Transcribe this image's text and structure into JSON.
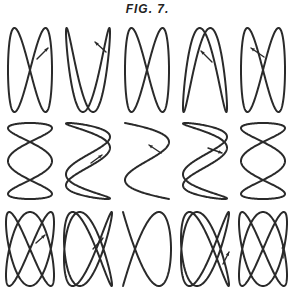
{
  "title": "FIG. 7.",
  "figure": {
    "rows": [
      {
        "name": "ratio-1-2",
        "fx": 1,
        "fy": 2,
        "cy": 70,
        "ry": 42,
        "rx": 22,
        "items": [
          {
            "cx": 30,
            "phase": 0.0,
            "arrow": {
              "x1": 37,
              "y1": 59,
              "x2": 48,
              "y2": 48
            }
          },
          {
            "cx": 88,
            "phase": 0.55,
            "arrow": {
              "x1": 106,
              "y1": 52,
              "x2": 95,
              "y2": 42
            }
          },
          {
            "cx": 147,
            "phase": 1.5708,
            "arrow": null
          },
          {
            "cx": 205,
            "phase": 2.6,
            "arrow": {
              "x1": 212,
              "y1": 62,
              "x2": 201,
              "y2": 51
            }
          },
          {
            "cx": 263,
            "phase": 3.14159,
            "arrow": {
              "x1": 264,
              "y1": 57,
              "x2": 251,
              "y2": 48
            }
          }
        ]
      },
      {
        "name": "ratio-3-1",
        "fx": 3,
        "fy": 1,
        "cy": 161,
        "ry": 38,
        "rx": 22,
        "items": [
          {
            "cx": 30,
            "phase": 1.5708,
            "arrow": null
          },
          {
            "cx": 88,
            "phase": 0.5,
            "arrow": {
              "x1": 91,
              "y1": 163,
              "x2": 102,
              "y2": 155
            }
          },
          {
            "cx": 147,
            "phase": 0.0,
            "arrow": {
              "x1": 161,
              "y1": 153,
              "x2": 149,
              "y2": 145
            }
          },
          {
            "cx": 205,
            "phase": -0.5,
            "arrow": {
              "x1": 208,
              "y1": 148,
              "x2": 222,
              "y2": 153
            }
          },
          {
            "cx": 263,
            "phase": -1.5708,
            "arrow": null
          }
        ]
      },
      {
        "name": "ratio-2-3",
        "fx": 2,
        "fy": 3,
        "cy": 249,
        "ry": 37,
        "rx": 24,
        "items": [
          {
            "cx": 30,
            "phase": 0.0,
            "arrow": {
              "x1": 36,
              "y1": 243,
              "x2": 45,
              "y2": 235
            }
          },
          {
            "cx": 88,
            "phase": 0.35,
            "arrow": {
              "x1": 93,
              "y1": 249,
              "x2": 103,
              "y2": 238
            }
          },
          {
            "cx": 147,
            "phase": 1.5708,
            "arrow": null
          },
          {
            "cx": 205,
            "phase": 2.8,
            "arrow": {
              "x1": 223,
              "y1": 264,
              "x2": 229,
              "y2": 252
            }
          },
          {
            "cx": 263,
            "phase": 3.14159,
            "arrow": {
              "x1": 283,
              "y1": 258,
              "x2": 283,
              "y2": 245
            }
          }
        ]
      }
    ]
  }
}
